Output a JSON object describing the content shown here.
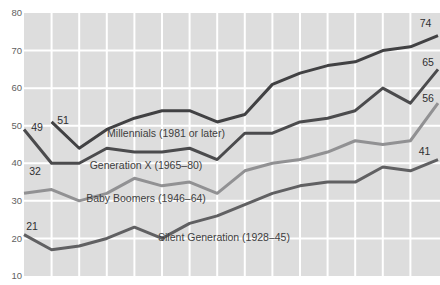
{
  "chart_data": {
    "type": "line",
    "title": "",
    "x_axis": {
      "labels_visible": false,
      "point_count": 16
    },
    "y_axis": {
      "min": 10,
      "max": 80,
      "tick_step": 10,
      "tick_labels": [
        "80",
        "70",
        "60",
        "50",
        "40",
        "30",
        "20",
        "10"
      ]
    },
    "grid": true,
    "legend_position": "inline-labels",
    "plot_background": "#dddddd",
    "gridline_color": "#ffffff",
    "series_label_color": "#3e3e40",
    "value_label_color": "#2f2f31",
    "axis_tick_color": "#5f5f5f",
    "series": [
      {
        "id": "millennials",
        "name": "Millennials (1981 or later)",
        "color": "#414143",
        "start_value_label": "51",
        "end_value_label": "74",
        "values": [
          null,
          51,
          44,
          49,
          52,
          54,
          54,
          51,
          53,
          61,
          64,
          66,
          67,
          70,
          71,
          74
        ]
      },
      {
        "id": "generation-x",
        "name": "Generation X (1965–80)",
        "color": "#4b4b4d",
        "start_value_label": "49",
        "end_value_label": "65",
        "values": [
          49,
          40,
          40,
          44,
          43,
          43,
          44,
          41,
          48,
          48,
          51,
          52,
          54,
          60,
          56,
          65
        ]
      },
      {
        "id": "baby-boomers",
        "name": "Baby Boomers (1946–64)",
        "color": "#919193",
        "start_value_label": "32",
        "end_value_label": "56",
        "values": [
          32,
          33,
          30,
          32,
          36,
          34,
          35,
          32,
          38,
          40,
          41,
          43,
          46,
          45,
          46,
          56
        ]
      },
      {
        "id": "silent-generation",
        "name": "Silent Generation (1928–45)",
        "color": "#606062",
        "start_value_label": "21",
        "end_value_label": "41",
        "values": [
          21,
          17,
          18,
          20,
          23,
          20,
          24,
          26,
          29,
          32,
          34,
          35,
          35,
          39,
          38,
          41
        ]
      }
    ]
  }
}
